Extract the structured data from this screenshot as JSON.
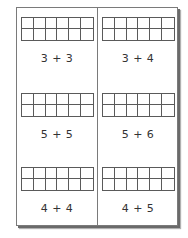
{
  "worksheet": {
    "grid": {
      "rows": 2,
      "columns": 6
    },
    "problems": [
      {
        "label": "3 + 3"
      },
      {
        "label": "3 + 4"
      },
      {
        "label": "5 + 5"
      },
      {
        "label": "5 + 6"
      },
      {
        "label": "4 + 4"
      },
      {
        "label": "4 + 5"
      }
    ]
  }
}
